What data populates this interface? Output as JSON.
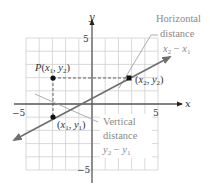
{
  "diagram": {
    "type": "coordinate-plane",
    "axes": {
      "x_label": "x",
      "y_label": "y",
      "x_ticks": [
        {
          "value": -5,
          "label": "−5"
        },
        {
          "value": 5,
          "label": "5"
        }
      ],
      "y_ticks": [
        {
          "value": 5,
          "label": "5"
        },
        {
          "value": -5,
          "label": "−5"
        }
      ],
      "range": [
        -5,
        5
      ],
      "grid": true
    },
    "points": [
      {
        "id": "p",
        "label_prefix": "P",
        "label": "P(x₁, y₂)",
        "x": -3,
        "y": 2
      },
      {
        "id": "p1",
        "label": "(x₁, y₁)",
        "x": -3,
        "y": -1
      },
      {
        "id": "p2",
        "label": "(x₂, y₂)",
        "x": 3,
        "y": 2
      }
    ],
    "line": {
      "from": [
        -6,
        -2.7
      ],
      "to": [
        5.9,
        3.6
      ],
      "arrow_both": true
    },
    "annotations": {
      "horizontal": {
        "line1": "Horizontal",
        "line2": "distance",
        "expr": "x₂ − x₁"
      },
      "vertical": {
        "line1": "Vertical",
        "line2": "distance",
        "expr": "y₂ − y₁"
      }
    },
    "colors": {
      "grid": "#c8c8c8",
      "axis": "#5a5a5a",
      "line": "#6e6e6e",
      "point": "#111111",
      "annotation_text": "#8a8a8a",
      "label_text": "#333333"
    }
  }
}
